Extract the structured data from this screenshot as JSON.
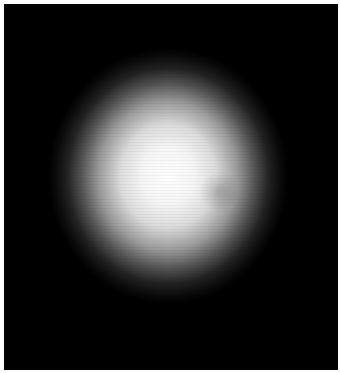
{
  "image": {
    "subject": "bright glowing sphere on black background",
    "background_color": "#000000",
    "glow_color": "#ffffff",
    "border_color": "#ffffff"
  }
}
